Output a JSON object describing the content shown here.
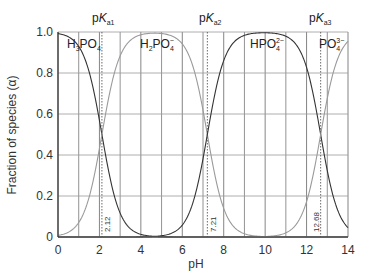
{
  "chart_data": {
    "type": "line",
    "title": "",
    "xlabel": "pH",
    "ylabel": "Fraction of species (α)",
    "xlim": [
      0,
      14
    ],
    "ylim": [
      0,
      1.0
    ],
    "x_ticks": [
      "0",
      "2",
      "4",
      "6",
      "8",
      "10",
      "12",
      "14"
    ],
    "y_ticks": [
      "0",
      "0.2",
      "0.4",
      "0.6",
      "0.8",
      "1.0"
    ],
    "grid": true,
    "pKa": [
      {
        "label": "pK",
        "sub": "a1",
        "value": 2.12,
        "value_label": "2.12"
      },
      {
        "label": "pK",
        "sub": "a2",
        "value": 7.21,
        "value_label": "7.21"
      },
      {
        "label": "pK",
        "sub": "a3",
        "value": 12.68,
        "value_label": "12.68"
      }
    ],
    "series": [
      {
        "name": "H3PO4",
        "label_main": "H",
        "label_parts": [
          "H",
          "3",
          "PO",
          "4",
          ""
        ],
        "color": "#333333"
      },
      {
        "name": "H2PO4-",
        "label_parts": [
          "H",
          "2",
          "PO",
          "4",
          "−"
        ],
        "color": "#9a9a9a"
      },
      {
        "name": "HPO4 2-",
        "label_parts": [
          "HPO",
          "",
          "",
          "4",
          "2−"
        ],
        "color": "#333333"
      },
      {
        "name": "PO4 3-",
        "label_parts": [
          "PO",
          "",
          "",
          "4",
          "3−"
        ],
        "color": "#9a9a9a"
      }
    ],
    "sample_points": {
      "x": [
        0,
        1,
        2,
        2.12,
        3,
        4,
        5,
        6,
        7,
        7.21,
        8,
        9,
        10,
        11,
        12,
        12.68,
        13,
        14
      ],
      "H3PO4": [
        0.99,
        0.93,
        0.57,
        0.5,
        0.12,
        0.01,
        0.0,
        0.0,
        0.0,
        0.0,
        0.0,
        0.0,
        0.0,
        0.0,
        0.0,
        0.0,
        0.0,
        0.0
      ],
      "H2PO4-": [
        0.01,
        0.07,
        0.43,
        0.5,
        0.88,
        0.98,
        0.99,
        0.94,
        0.62,
        0.5,
        0.14,
        0.02,
        0.0,
        0.0,
        0.0,
        0.0,
        0.0,
        0.0
      ],
      "HPO4 2-": [
        0.0,
        0.0,
        0.0,
        0.0,
        0.0,
        0.0,
        0.01,
        0.06,
        0.38,
        0.5,
        0.86,
        0.98,
        1.0,
        0.98,
        0.83,
        0.5,
        0.32,
        0.05
      ],
      "PO4 3-": [
        0.0,
        0.0,
        0.0,
        0.0,
        0.0,
        0.0,
        0.0,
        0.0,
        0.0,
        0.0,
        0.0,
        0.0,
        0.0,
        0.02,
        0.17,
        0.5,
        0.68,
        0.95
      ]
    }
  },
  "labels": {
    "xlabel": "pH",
    "ylabel": "Fraction of species (α)",
    "pk1": {
      "p": "p",
      "K": "K",
      "sub": "a1"
    },
    "pk2": {
      "p": "p",
      "K": "K",
      "sub": "a2"
    },
    "pk3": {
      "p": "p",
      "K": "K",
      "sub": "a3"
    },
    "pk1_value": "2.12",
    "pk2_value": "7.21",
    "pk3_value": "12.68",
    "sp1": {
      "a": "H",
      "b": "3",
      "c": "PO",
      "d": "4"
    },
    "sp2": {
      "a": "H",
      "b": "2",
      "c": "PO",
      "d": "4",
      "e": "−"
    },
    "sp3": {
      "a": "HPO",
      "d": "4",
      "e": "2−"
    },
    "sp4": {
      "a": "PO",
      "d": "4",
      "e": "3−"
    }
  }
}
